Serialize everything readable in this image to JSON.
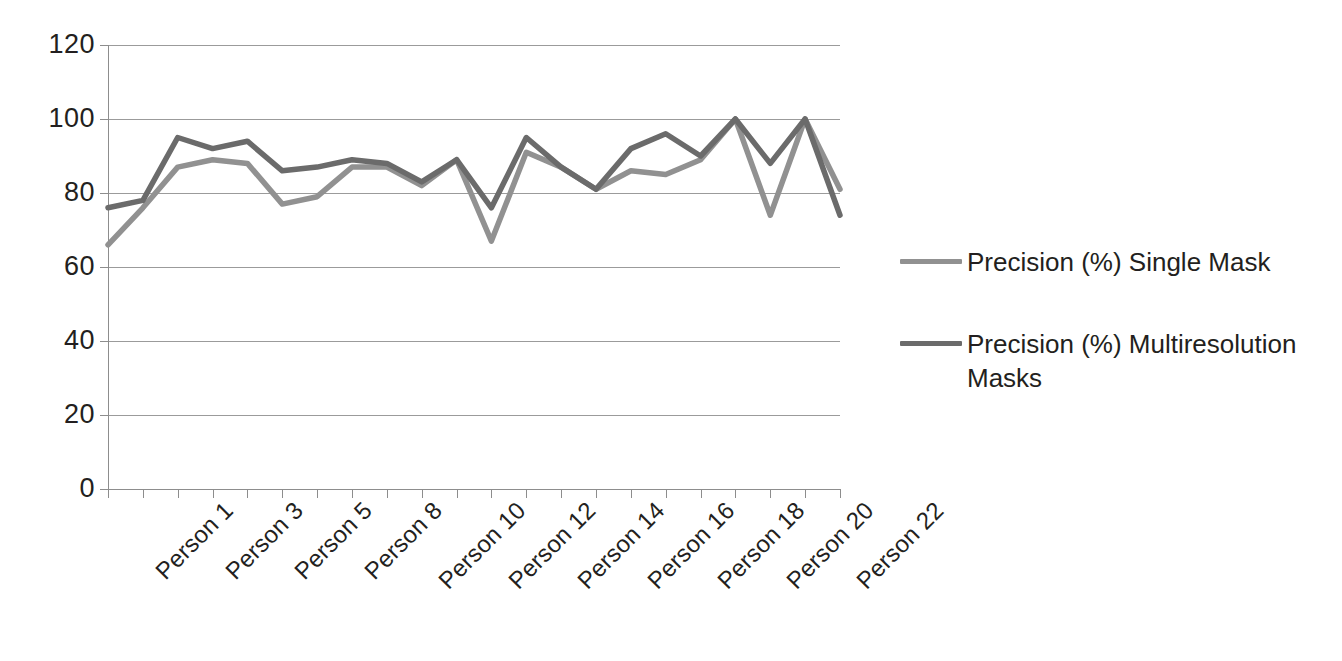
{
  "chart_data": {
    "type": "line",
    "title": "",
    "subtitle": "",
    "xlabel": "",
    "ylabel": "",
    "ylim": [
      0,
      120
    ],
    "y_ticks": [
      0,
      20,
      40,
      60,
      80,
      100,
      120
    ],
    "grid": "horizontal",
    "legend_position": "right",
    "categories": [
      "Person 1",
      "Person 2",
      "Person 3",
      "Person 4",
      "Person 5",
      "Person 6",
      "Person 8",
      "Person 9",
      "Person 10",
      "Person 11",
      "Person 12",
      "Person 13",
      "Person 14",
      "Person 15",
      "Person 16",
      "Person 17",
      "Person 18",
      "Person 19",
      "Person 20",
      "Person 21",
      "Person 22",
      "Person 23"
    ],
    "x_tick_labels_shown": [
      "Person 1",
      "Person 3",
      "Person 5",
      "Person 8",
      "Person 10",
      "Person 12",
      "Person 14",
      "Person 16",
      "Person 18",
      "Person 20",
      "Person 22"
    ],
    "series": [
      {
        "name": "Precision (%) Single Mask",
        "color": "#919191",
        "values": [
          66,
          76,
          87,
          89,
          88,
          77,
          79,
          87,
          87,
          82,
          89,
          67,
          91,
          87,
          81,
          86,
          85,
          89,
          100,
          74,
          100,
          81
        ]
      },
      {
        "name": "Precision (%) Multiresolution Masks",
        "color": "#6b6b6b",
        "values": [
          76,
          78,
          95,
          92,
          94,
          86,
          87,
          89,
          88,
          83,
          89,
          76,
          95,
          87,
          81,
          92,
          96,
          90,
          100,
          88,
          100,
          74
        ]
      }
    ]
  },
  "legend": {
    "entries": [
      {
        "label": "Precision (%) Single Mask",
        "color": "#919191"
      },
      {
        "label": "Precision (%) Multiresolution Masks",
        "color": "#6b6b6b"
      }
    ]
  },
  "axes": {
    "y_tick_labels": [
      "120",
      "100",
      "80",
      "60",
      "40",
      "20",
      "0"
    ]
  }
}
